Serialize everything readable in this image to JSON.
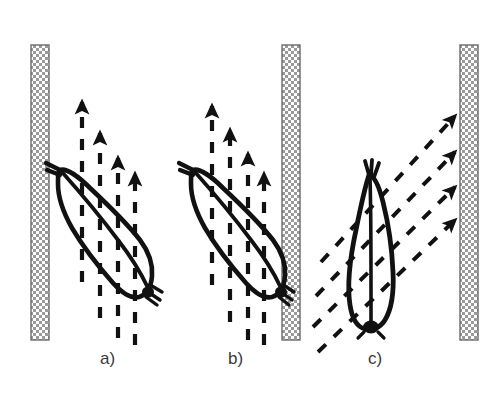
{
  "figure": {
    "background_color": "#ffffff",
    "ink_color": "#111111",
    "wall_fill_color": "#d9d9d9",
    "wall_edge_color": "#6b6b6b",
    "label_color": "#3a3a3a",
    "width": 500,
    "height": 405
  },
  "panels": [
    {
      "id": "a",
      "label": "a)",
      "label_x": 100,
      "label_y": 349,
      "description": "spermatozoon tilted head-up-left beside left wall with vertical dashed flow arrows",
      "cell_orientation": "diagonal",
      "flow_direction": "upward",
      "arrow_count": 4,
      "dashed_line_count": 6
    },
    {
      "id": "b",
      "label": "b)",
      "label_x": 228,
      "label_y": 349,
      "description": "spermatozoon tilted head-up-left beside right wall with vertical dashed flow arrows",
      "cell_orientation": "diagonal",
      "flow_direction": "upward",
      "arrow_count": 4,
      "dashed_line_count": 6
    },
    {
      "id": "c",
      "label": "c)",
      "label_x": 368,
      "label_y": 349,
      "description": "upright spermatozoon with diagonal dashed flow arrows directed up toward the right wall",
      "cell_orientation": "vertical",
      "flow_direction": "diagonal-up-right",
      "arrow_count": 4,
      "dashed_line_count": 4
    }
  ],
  "walls": [
    {
      "name": "left-wall",
      "x": 31,
      "y": 45,
      "width": 18,
      "height": 295
    },
    {
      "name": "middle-wall",
      "x": 282,
      "y": 45,
      "width": 18,
      "height": 295
    },
    {
      "name": "right-wall",
      "x": 460,
      "y": 45,
      "width": 18,
      "height": 295
    }
  ],
  "flow_arrows": {
    "panel_a": [
      {
        "x": 82,
        "top": 100,
        "bottom": 282
      },
      {
        "x": 100,
        "top": 131,
        "bottom": 318
      },
      {
        "x": 118,
        "top": 156,
        "bottom": 338
      },
      {
        "x": 135,
        "top": 172,
        "bottom": 345
      }
    ],
    "panel_b": [
      {
        "x": 212,
        "top": 104,
        "bottom": 285
      },
      {
        "x": 230,
        "top": 128,
        "bottom": 322
      },
      {
        "x": 248,
        "top": 152,
        "bottom": 340
      },
      {
        "x": 264,
        "top": 172,
        "bottom": 345
      }
    ],
    "panel_c": [
      {
        "x1": 321,
        "y1": 262,
        "x2": 457,
        "y2": 114
      },
      {
        "x1": 316,
        "y1": 296,
        "x2": 457,
        "y2": 150
      },
      {
        "x1": 313,
        "y1": 327,
        "x2": 457,
        "y2": 185
      },
      {
        "x1": 318,
        "y1": 352,
        "x2": 457,
        "y2": 218
      }
    ]
  }
}
